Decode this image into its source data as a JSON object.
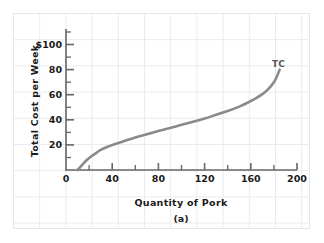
{
  "chart_data": {
    "type": "line",
    "title": "",
    "panel_label": "(a)",
    "xlabel": "Quantity of Pork",
    "ylabel": "Total Cost  per Week",
    "xlim": [
      0,
      200
    ],
    "ylim": [
      0,
      110
    ],
    "xticks": [
      0,
      40,
      80,
      120,
      160,
      200
    ],
    "xtick_labels": [
      "0",
      "40",
      "80",
      "120",
      "160",
      "200"
    ],
    "xminor_step": 20,
    "yticks": [
      20,
      40,
      60,
      80,
      100
    ],
    "ytick_labels": [
      "20",
      "40",
      "60",
      "80",
      "$100"
    ],
    "yminor_step": 10,
    "grid": "background-only",
    "legend": "inline-label",
    "series": [
      {
        "name": "TC",
        "label": "TC",
        "color": "#8a8a8a",
        "x": [
          10,
          14,
          18,
          22,
          26,
          30,
          36,
          42,
          50,
          60,
          70,
          80,
          90,
          100,
          110,
          120,
          130,
          140,
          150,
          158,
          165,
          170,
          174,
          178,
          181,
          183,
          185
        ],
        "y": [
          0,
          4,
          8,
          11,
          13.5,
          16,
          18.5,
          20.5,
          23,
          26,
          28.5,
          31,
          33.5,
          36,
          38.5,
          41,
          44,
          47,
          50.5,
          54,
          57.5,
          60.5,
          63.5,
          67.5,
          71.5,
          75.5,
          80
        ]
      }
    ],
    "colors": {
      "curve": "#8a8a8a",
      "axis": "#666666",
      "text": "#1a1a1a",
      "grid": "#e8ecf2",
      "background": "#ffffff"
    }
  }
}
